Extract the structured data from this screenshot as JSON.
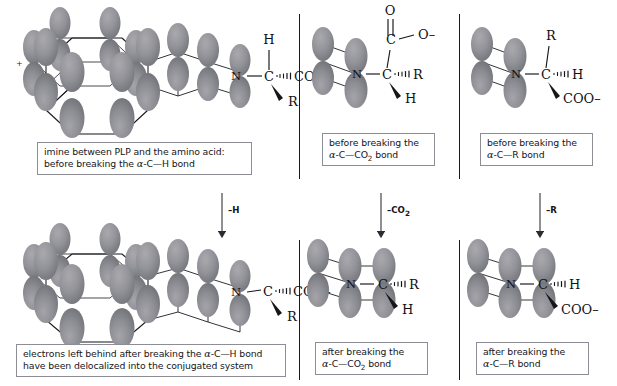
{
  "figure": {
    "background": "#ffffff",
    "orbital_color": "#8e8e92",
    "orbital_color_dark": "#7b7b80",
    "line_color": "#15151a",
    "caption_border_color": "#8d8d96"
  },
  "top_row": {
    "left": {
      "caption_line1": "imine between PLP and the amino acid:",
      "caption_line2_pre": "before breaking the ",
      "caption_line2_alpha": "α",
      "caption_line2_post": "-C—H bond",
      "structure": {
        "ring_atom": "N",
        "ring_charge": "+",
        "alpha_carbon": "C",
        "substituent_up": "H",
        "substituent_hashed": "COO–",
        "substituent_wedge": "R"
      }
    },
    "middle": {
      "caption_line1": "before breaking the",
      "caption_line2_alpha": "α",
      "caption_line2_pre": "-C—CO",
      "caption_line2_sub": "2",
      "caption_line2_post": " bond",
      "structure": {
        "ring_atom": "N",
        "alpha_carbon": "C",
        "carboxyl_carbon": "C",
        "carbonyl_oxygen": "O",
        "anion_oxygen": "O–",
        "substituent_hashed": "R",
        "substituent_wedge": "H"
      }
    },
    "right": {
      "caption_line1": "before breaking the",
      "caption_line2_alpha": "α",
      "caption_line2_post": "-C—R bond",
      "structure": {
        "ring_atom": "N",
        "alpha_carbon": "C",
        "substituent_up": "R",
        "substituent_hashed": "H",
        "substituent_wedge": "COO–"
      }
    }
  },
  "arrows": {
    "left": {
      "label_pre": "–H",
      "label_sub": ""
    },
    "middle": {
      "label_pre": "–CO",
      "label_sub": "2"
    },
    "right": {
      "label_pre": "–R",
      "label_sub": ""
    }
  },
  "bottom_row": {
    "left": {
      "caption_line1_pre": "electrons left behind after breaking the ",
      "caption_line1_alpha": "α",
      "caption_line1_post": "-C—H bond",
      "caption_line2": "have been delocalized into the conjugated system",
      "structure": {
        "ring_atom": "N",
        "alpha_carbon": "C",
        "substituent_hashed": "COO–",
        "substituent_wedge": "R"
      }
    },
    "middle": {
      "caption_line1": "after breaking the",
      "caption_line2_alpha": "α",
      "caption_line2_pre": "-C—CO",
      "caption_line2_sub": "2",
      "caption_line2_post": " bond",
      "structure": {
        "ring_atom": "N",
        "alpha_carbon": "C",
        "substituent_hashed": "R",
        "substituent_wedge": "H"
      }
    },
    "right": {
      "caption_line1": "after breaking the",
      "caption_line2_alpha": "α",
      "caption_line2_post": "-C—R bond",
      "structure": {
        "ring_atom": "N",
        "alpha_carbon": "C",
        "substituent_hashed": "H",
        "substituent_wedge": "COO–"
      }
    }
  }
}
